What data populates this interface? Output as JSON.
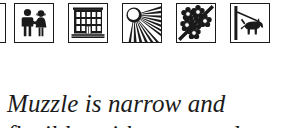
{
  "page": {
    "background_color": "#ffffff",
    "ink_color": "#1a1a1a"
  },
  "pictograms": {
    "partial_left": {
      "name": "partial-pictogram-cut-off",
      "alt": "edge of preceding pictogram tile, cropped"
    },
    "items": [
      {
        "id": "children-holding-hands",
        "icon": "children-icon",
        "alt": "Two children holding hands"
      },
      {
        "id": "building",
        "icon": "building-icon",
        "alt": "Multi-storey building with windows and a central door",
        "window_columns": 5,
        "window_rows": 3
      },
      {
        "id": "sun-rays",
        "icon": "sun-rays-icon",
        "alt": "Sun with radiating rays",
        "ray_count": 12
      },
      {
        "id": "no-flowers",
        "icon": "no-flowers-icon",
        "alt": "Cluster of flowers crossed out by a diagonal slash",
        "flower_count": 6
      },
      {
        "id": "dog-on-leash",
        "icon": "dog-on-leash-icon",
        "alt": "Dog on a leash tied to a post"
      }
    ]
  },
  "caption": {
    "line_1": "Muzzle is narrow and",
    "line_2": "flexible, with a tapered"
  }
}
